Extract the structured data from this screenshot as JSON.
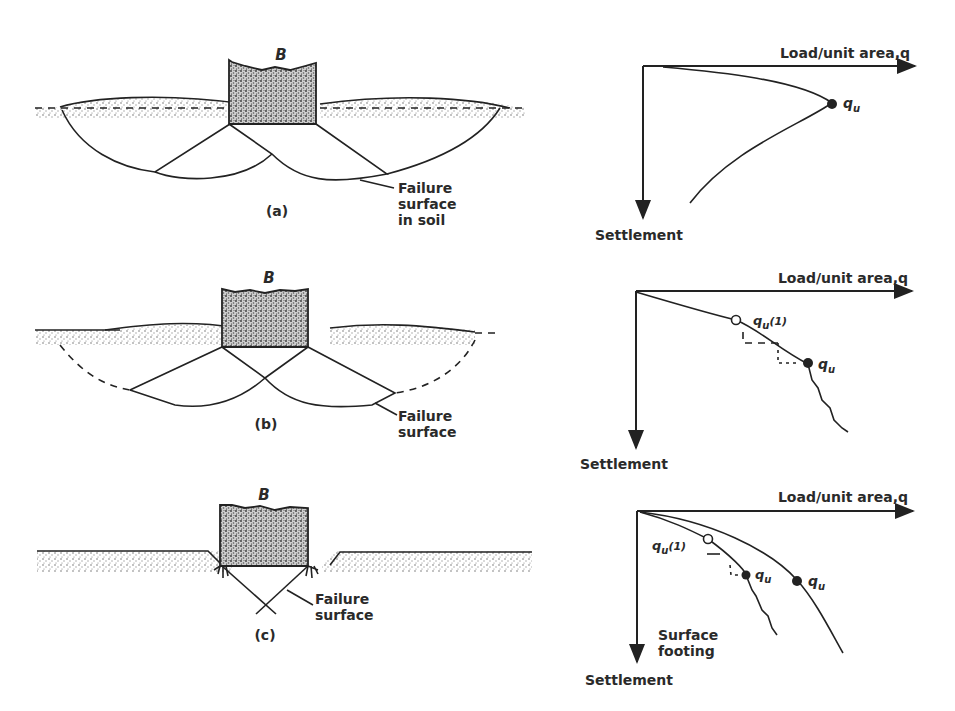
{
  "figure": {
    "panels": [
      {
        "id": "a",
        "caption": "(a)",
        "footing_label": "B",
        "annotation": [
          "Failure",
          "surface",
          "in soil"
        ],
        "chart": {
          "x_axis_label": "Load/unit area,q",
          "y_axis_label": "Settlement",
          "point_labels": [
            {
              "text": "q",
              "sub": "u",
              "type": "filled"
            }
          ]
        }
      },
      {
        "id": "b",
        "caption": "(b)",
        "footing_label": "B",
        "annotation": [
          "Failure",
          "surface"
        ],
        "chart": {
          "x_axis_label": "Load/unit area,q",
          "y_axis_label": "Settlement",
          "point_labels": [
            {
              "text": "q",
              "sub": "u",
              "suffix": "(1)",
              "type": "open"
            },
            {
              "text": "q",
              "sub": "u",
              "type": "filled"
            }
          ]
        }
      },
      {
        "id": "c",
        "caption": "(c)",
        "footing_label": "B",
        "annotation": [
          "Failure",
          "surface"
        ],
        "chart": {
          "x_axis_label": "Load/unit area,q",
          "y_axis_label": "Settlement",
          "curve_note": [
            "Surface",
            "footing"
          ],
          "point_labels": [
            {
              "text": "q",
              "sub": "u",
              "suffix": "(1)",
              "type": "open"
            },
            {
              "text": "q",
              "sub": "u",
              "type": "filled"
            },
            {
              "text": "q",
              "sub": "u",
              "type": "filled"
            }
          ]
        }
      }
    ]
  },
  "colors": {
    "ink": "#222222",
    "background": "#ffffff",
    "soil_stipple": "#9a9a9a"
  }
}
